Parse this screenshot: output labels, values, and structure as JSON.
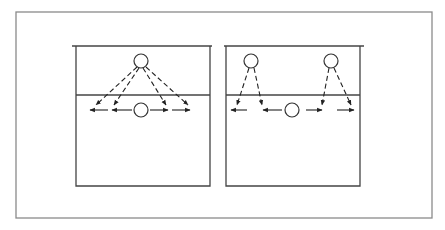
{
  "diagram": {
    "type": "volleyball-formation",
    "colors": {
      "frame": "#8a8a8a",
      "lines": "#222222",
      "background": "#ffffff"
    },
    "frame": {
      "x": 16,
      "y": 12,
      "w": 416,
      "h": 206
    },
    "panels": [
      {
        "id": "left",
        "court": {
          "left": 76,
          "right": 210,
          "top": 46,
          "topExtL": 72,
          "topExtR": 212,
          "net": 95,
          "bottom": 186
        },
        "players": [
          {
            "role": "front",
            "cx": 141,
            "cy": 61,
            "r": 7
          },
          {
            "role": "back",
            "cx": 141,
            "cy": 110,
            "r": 7
          }
        ],
        "dashed_paths": [
          {
            "from": [
              137,
              67
            ],
            "to": [
              96,
              105
            ]
          },
          {
            "from": [
              139,
              68
            ],
            "to": [
              114,
              105
            ]
          },
          {
            "from": [
              143,
              68
            ],
            "to": [
              166,
              105
            ]
          },
          {
            "from": [
              146,
              67
            ],
            "to": [
              188,
              105
            ]
          }
        ],
        "arrows": [
          {
            "from": [
              108,
              110
            ],
            "to": [
              90,
              110
            ]
          },
          {
            "from": [
              132,
              110
            ],
            "to": [
              112,
              110
            ]
          },
          {
            "from": [
              150,
              110
            ],
            "to": [
              168,
              110
            ]
          },
          {
            "from": [
              172,
              110
            ],
            "to": [
              190,
              110
            ]
          }
        ]
      },
      {
        "id": "right",
        "court": {
          "left": 226,
          "right": 360,
          "top": 46,
          "topExtL": 224,
          "topExtR": 364,
          "net": 95,
          "bottom": 186
        },
        "players": [
          {
            "role": "front-left",
            "cx": 251,
            "cy": 61,
            "r": 7
          },
          {
            "role": "front-right",
            "cx": 331,
            "cy": 61,
            "r": 7
          },
          {
            "role": "back",
            "cx": 292,
            "cy": 110,
            "r": 7
          }
        ],
        "dashed_paths": [
          {
            "from": [
              249,
              68
            ],
            "to": [
              237,
              105
            ]
          },
          {
            "from": [
              254,
              68
            ],
            "to": [
              262,
              105
            ]
          },
          {
            "from": [
              329,
              68
            ],
            "to": [
              322,
              105
            ]
          },
          {
            "from": [
              334,
              68
            ],
            "to": [
              351,
              105
            ]
          }
        ],
        "arrows": [
          {
            "from": [
              247,
              110
            ],
            "to": [
              231,
              110
            ]
          },
          {
            "from": [
              282,
              110
            ],
            "to": [
              263,
              110
            ]
          },
          {
            "from": [
              306,
              110
            ],
            "to": [
              322,
              110
            ]
          },
          {
            "from": [
              337,
              110
            ],
            "to": [
              354,
              110
            ]
          }
        ]
      }
    ]
  }
}
